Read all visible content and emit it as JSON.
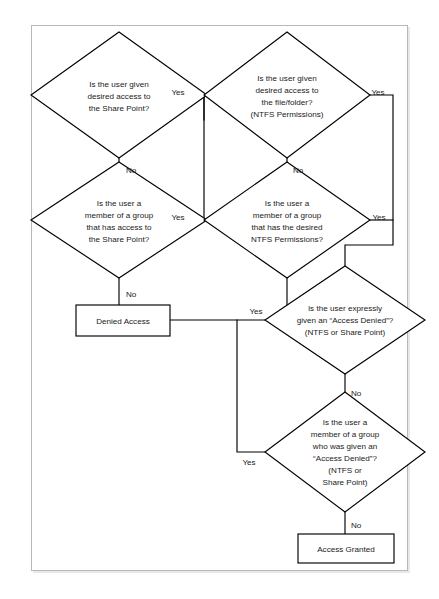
{
  "document": {
    "type": "flowchart",
    "title": "Share Point / NTFS Permissions Access Decision Flowchart",
    "background_color": "#ffffff",
    "sheet_color": "#ffffff",
    "sheet_border_color": "#b8b8b8",
    "shape_stroke_color": "#000000",
    "text_color": "#1a1a1a"
  },
  "nodes": {
    "q1": {
      "id": "q1",
      "shape": "diamond",
      "lines": [
        "Is the user given",
        "desired access to",
        "the Share Point?"
      ],
      "cx": 119,
      "cy": 95,
      "rx": 88,
      "ry": 63
    },
    "q2": {
      "id": "q2",
      "shape": "diamond",
      "lines": [
        "Is the user a",
        "member of a group",
        "that has access to",
        "the Share Point?"
      ],
      "cx": 119,
      "cy": 220,
      "rx": 88,
      "ry": 58
    },
    "q3": {
      "id": "q3",
      "shape": "diamond",
      "lines": [
        "Is the user given",
        "desired access to",
        "the file/folder?",
        "(NTFS Permissions)"
      ],
      "cx": 287,
      "cy": 95,
      "rx": 83,
      "ry": 63
    },
    "q4": {
      "id": "q4",
      "shape": "diamond",
      "lines": [
        "Is the user a",
        "member of a group",
        "that has the desired",
        "NTFS Permissions?"
      ],
      "cx": 287,
      "cy": 220,
      "rx": 83,
      "ry": 58
    },
    "q5": {
      "id": "q5",
      "shape": "diamond",
      "lines": [
        "Is the user expressly",
        "given an “Access Denied”?",
        "(NTFS or Share Point)"
      ],
      "cx": 345,
      "cy": 320,
      "rx": 80,
      "ry": 54
    },
    "q6": {
      "id": "q6",
      "shape": "diamond",
      "lines": [
        "Is the user a",
        "member of a group",
        "who was given an",
        "“Access Denied”?",
        "(NTFS or",
        "Share Point)"
      ],
      "cx": 345,
      "cy": 452,
      "rx": 80,
      "ry": 60
    },
    "denied": {
      "id": "denied",
      "shape": "rect",
      "label": "Denied Access",
      "x": 76,
      "y": 305,
      "w": 94,
      "h": 31
    },
    "granted": {
      "id": "granted",
      "shape": "rect",
      "label": "Access Granted",
      "x": 298,
      "y": 534,
      "w": 96,
      "h": 29
    }
  },
  "edges": [
    {
      "from": "q1",
      "to": "q3",
      "label": "Yes",
      "label_x": 178,
      "label_y": 92
    },
    {
      "from": "q1",
      "to": "q2",
      "label": "No",
      "label_x": 124,
      "label_y": 164
    },
    {
      "from": "q2",
      "to": "q3",
      "label": "Yes",
      "label_x": 178,
      "label_y": 217
    },
    {
      "from": "q2",
      "to": "denied",
      "label": "No",
      "label_x": 124,
      "label_y": 294
    },
    {
      "from": "q3",
      "to": "q5",
      "label": "Yes",
      "label_x": 378,
      "label_y": 92
    },
    {
      "from": "q3",
      "to": "q4",
      "label": "No",
      "label_x": 292,
      "label_y": 164
    },
    {
      "from": "q4",
      "to": "q5",
      "label": "Yes",
      "label_x": 378,
      "label_y": 217
    },
    {
      "from": "q4",
      "to": "denied",
      "label": "No",
      "label_x": 292,
      "label_y": 294
    },
    {
      "from": "denied",
      "to": "q5",
      "label": "Yes",
      "label_x": 255,
      "label_y": 310
    },
    {
      "from": "q5",
      "to": "q6",
      "label": "No",
      "label_x": 350,
      "label_y": 388
    },
    {
      "from": "denied",
      "to": "q6",
      "label": "Yes",
      "label_x": 255,
      "label_y": 462
    },
    {
      "from": "q6",
      "to": "granted",
      "label": "No",
      "label_x": 350,
      "label_y": 523
    }
  ],
  "edge_labels": {
    "yes": "Yes",
    "no": "No"
  }
}
